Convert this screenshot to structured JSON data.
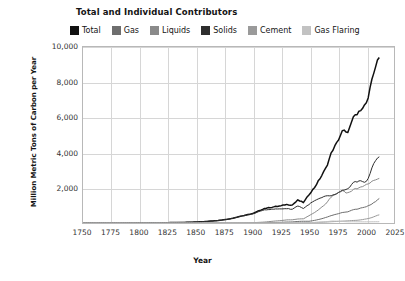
{
  "chart_data": {
    "type": "line",
    "title": "Total and Individual Contributors",
    "xlabel": "Year",
    "ylabel": "Million Metric Tons of Carbon per Year",
    "xlim": [
      1750,
      2025
    ],
    "ylim": [
      0,
      10000
    ],
    "xticks": [
      1750,
      1775,
      1800,
      1825,
      1850,
      1875,
      1900,
      1925,
      1950,
      1975,
      2000,
      2025
    ],
    "yticks": [
      0,
      2000,
      4000,
      6000,
      8000,
      10000
    ],
    "ytick_labels": [
      "",
      "2,000",
      "4,000",
      "6,000",
      "8,000",
      "10,000"
    ],
    "grid": true,
    "legend_position": "top-left",
    "x": [
      1751,
      1760,
      1780,
      1800,
      1820,
      1840,
      1850,
      1860,
      1870,
      1880,
      1890,
      1900,
      1910,
      1920,
      1925,
      1930,
      1935,
      1940,
      1945,
      1950,
      1955,
      1960,
      1965,
      1970,
      1975,
      1980,
      1983,
      1985,
      1990,
      1992,
      1995,
      2000,
      2002,
      2005,
      2008,
      2010,
      2012
    ],
    "series": [
      {
        "name": "Total",
        "color": "#111111",
        "values": [
          3,
          4,
          6,
          8,
          15,
          35,
          54,
          91,
          147,
          236,
          396,
          534,
          819,
          932,
          975,
          1053,
          1022,
          1299,
          1160,
          1630,
          2043,
          2577,
          3140,
          4053,
          4615,
          5315,
          5084,
          5281,
          6143,
          6119,
          6399,
          6765,
          6995,
          8063,
          8738,
          9167,
          9400
        ]
      },
      {
        "name": "Gas",
        "color": "#6e6e6e",
        "values": [
          0,
          0,
          0,
          0,
          0,
          0,
          0,
          0,
          0,
          1,
          3,
          9,
          19,
          29,
          36,
          55,
          60,
          88,
          100,
          97,
          150,
          227,
          316,
          440,
          514,
          620,
          612,
          667,
          779,
          790,
          830,
          928,
          962,
          1069,
          1202,
          1294,
          1400
        ]
      },
      {
        "name": "Liquids",
        "color": "#8a8a8a",
        "values": [
          0,
          0,
          0,
          0,
          0,
          0,
          0,
          0,
          1,
          3,
          7,
          18,
          51,
          111,
          135,
          178,
          181,
          230,
          236,
          423,
          601,
          849,
          1119,
          1532,
          1680,
          1859,
          1705,
          1722,
          1934,
          1954,
          2019,
          2174,
          2177,
          2346,
          2432,
          2470,
          2500
        ]
      },
      {
        "name": "Solids",
        "color": "#2e2e2e",
        "values": [
          3,
          4,
          6,
          8,
          15,
          35,
          54,
          91,
          146,
          232,
          386,
          507,
          749,
          792,
          804,
          820,
          780,
          979,
          824,
          1070,
          1270,
          1410,
          1527,
          1556,
          1673,
          1874,
          1900,
          1955,
          2360,
          2283,
          2386,
          2342,
          2480,
          3040,
          3478,
          3682,
          3800
        ]
      },
      {
        "name": "Cement",
        "color": "#9a9a9a",
        "values": [
          0,
          0,
          0,
          0,
          0,
          0,
          0,
          0,
          0,
          0,
          0,
          1,
          2,
          5,
          6,
          9,
          10,
          13,
          11,
          18,
          29,
          42,
          55,
          75,
          88,
          110,
          118,
          125,
          146,
          153,
          170,
          226,
          250,
          300,
          380,
          420,
          470
        ]
      },
      {
        "name": "Gas Flaring",
        "color": "#c2c2c2",
        "values": [
          0,
          0,
          0,
          0,
          0,
          0,
          0,
          0,
          0,
          0,
          0,
          0,
          0,
          0,
          0,
          1,
          2,
          4,
          6,
          23,
          36,
          55,
          74,
          111,
          104,
          86,
          74,
          70,
          71,
          68,
          66,
          65,
          66,
          68,
          70,
          71,
          72
        ]
      }
    ]
  },
  "legend": {
    "items": [
      {
        "label": "Total",
        "color": "#111111"
      },
      {
        "label": "Gas",
        "color": "#6e6e6e"
      },
      {
        "label": "Liquids",
        "color": "#8a8a8a"
      },
      {
        "label": "Solids",
        "color": "#2e2e2e"
      },
      {
        "label": "Cement",
        "color": "#9a9a9a"
      },
      {
        "label": "Gas Flaring",
        "color": "#c2c2c2"
      }
    ]
  }
}
